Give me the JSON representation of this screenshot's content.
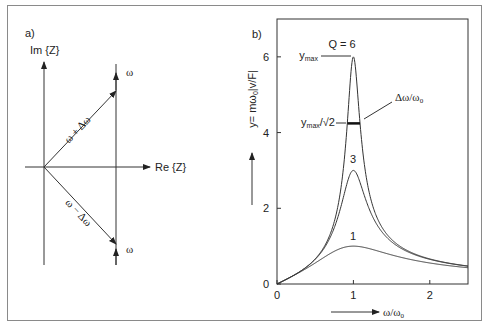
{
  "panel_a": {
    "label": "a)",
    "im_axis_label": "Im {Z}",
    "re_axis_label": "Re {Z}",
    "upper_vector_label": "ω + Δω",
    "lower_vector_label": "ω − Δω",
    "upper_omega_label": "ω",
    "lower_omega_label": "ω"
  },
  "panel_b": {
    "label": "b)",
    "ymax_label": "y",
    "ymax_sub": "max",
    "half_label": "y",
    "half_sub": "max",
    "half_suffix": "/√2",
    "bandwidth_label": "Δω/ω",
    "bandwidth_sub": "0",
    "q_label": "Q = 6",
    "curve_label_3": "3",
    "curve_label_1": "1",
    "x_axis_label": "ω/ω",
    "x_axis_sub": "0",
    "y_axis_label_prefix": "y= mω",
    "y_axis_label_sub": "0",
    "y_axis_label_suffix": "|v/F|"
  },
  "chart_data": {
    "type": "line",
    "title": "",
    "xlabel": "ω/ω0",
    "ylabel": "y = mω0|v/F|",
    "xlim": [
      0,
      2.5
    ],
    "ylim": [
      0,
      7
    ],
    "x_ticks": [
      "0",
      "1",
      "2"
    ],
    "x_tick_values": [
      0,
      1,
      2
    ],
    "y_ticks": [
      "0",
      "2",
      "4",
      "6"
    ],
    "y_tick_values": [
      0,
      2,
      4,
      6
    ],
    "grid": false,
    "formula": "y = r / sqrt((1 - r^2)^2 + r^2 / Q^2)",
    "series": [
      {
        "name": "Q = 6",
        "Q": 6,
        "peak": 6
      },
      {
        "name": "3",
        "Q": 3,
        "peak": 3
      },
      {
        "name": "1",
        "Q": 1,
        "peak": 1
      }
    ],
    "annotations": [
      {
        "text": "ymax",
        "at": [
          1,
          6
        ]
      },
      {
        "text": "ymax/√2",
        "at": [
          1,
          4.24
        ]
      },
      {
        "text": "Δω/ω0",
        "refers_to": "bandwidth at ymax/√2"
      }
    ]
  }
}
